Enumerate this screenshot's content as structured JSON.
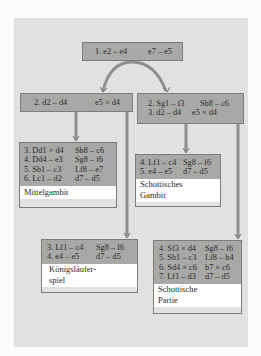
{
  "colors": {
    "background": "#fbfbf9",
    "panel": "#e1e1df",
    "move_box": "#a8a8a6",
    "label_box": "#ffffff",
    "arrow": "#8e8e8c",
    "border": "#7c7c7a"
  },
  "nodes": {
    "root": {
      "moves": [
        {
          "white": "1. e2 – e4",
          "black": "e7 – e5"
        }
      ]
    },
    "center": {
      "moves": [
        {
          "white": "2. d2 – d4",
          "black": "e5 × d4"
        }
      ]
    },
    "scotch": {
      "moves": [
        {
          "white": "2. Sg1 – f3",
          "black": "Sb8 – c6"
        },
        {
          "white": "3. d2 – d4",
          "black": "e5 × d4"
        }
      ]
    },
    "mittelgambit": {
      "moves": [
        {
          "white": "3. Dd1 × d4",
          "black": "Sb8 – c6"
        },
        {
          "white": "4. Dd4 – e3",
          "black": "Sg8 – f6"
        },
        {
          "white": "5. Sb1 – c3",
          "black": "Lf8 – e7"
        },
        {
          "white": "6. Lc1 – d2",
          "black": "d7 – d5"
        }
      ],
      "label": "Mittelgambit"
    },
    "schottisches_gambit": {
      "moves": [
        {
          "white": "4. Lf1 – c4",
          "black": "Sg8 – f6"
        },
        {
          "white": "5. e4 – e5",
          "black": "d7 – d5"
        }
      ],
      "label_lines": [
        "Schottisches",
        "Gambit"
      ]
    },
    "koenigslaeuferspiel": {
      "moves": [
        {
          "white": "3. Lf1 – c4",
          "black": "Sg8 – f6"
        },
        {
          "white": "4. e4 – e5",
          "black": "d7 – d5"
        }
      ],
      "label_lines": [
        "Königsläufer-",
        "spiel"
      ]
    },
    "schottische_partie": {
      "moves": [
        {
          "white": "4. Sf3 × d4",
          "black": "Sg8 – f6"
        },
        {
          "white": "5. Sb1 – c3",
          "black": "Lf8 – b4"
        },
        {
          "white": "6. Sd4 × c6",
          "black": "b7 × c6"
        },
        {
          "white": "7. Lf1 – d3",
          "black": "d7 – d5"
        }
      ],
      "label_lines": [
        "Schottische",
        "Partie"
      ]
    }
  }
}
